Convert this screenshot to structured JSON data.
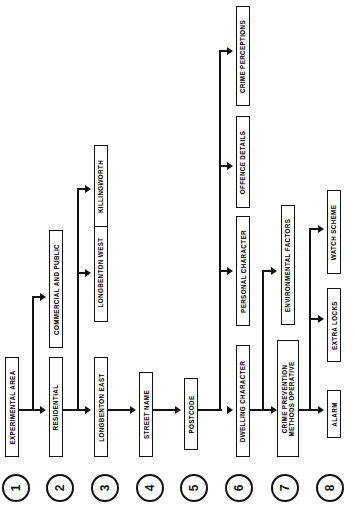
{
  "diagram": {
    "orientation": "rotated-90",
    "levels": [
      {
        "number": "1",
        "nodes": [
          {
            "id": "experimental-area",
            "label": "EXPERIMENTAL AREA"
          }
        ]
      },
      {
        "number": "2",
        "nodes": [
          {
            "id": "residential",
            "label": "RESIDENTIAL"
          },
          {
            "id": "commercial-and-public",
            "label": "COMMERCIAL AND PUBLIC"
          }
        ]
      },
      {
        "number": "3",
        "nodes": [
          {
            "id": "longbenton-east",
            "label": "LONGBENTON EAST"
          },
          {
            "id": "longbenton-west",
            "label": "LONGBENTON WEST"
          },
          {
            "id": "killingworth",
            "label": "KILLINGWORTH"
          }
        ]
      },
      {
        "number": "4",
        "nodes": [
          {
            "id": "street-name",
            "label": "STREET NAME"
          }
        ]
      },
      {
        "number": "5",
        "nodes": [
          {
            "id": "postcode",
            "label": "POSTCODE"
          }
        ]
      },
      {
        "number": "6",
        "nodes": [
          {
            "id": "dwelling-character",
            "label": "DWELLING CHARACTER"
          },
          {
            "id": "personal-character",
            "label": "PERSONAL CHARACTER"
          },
          {
            "id": "offence-details",
            "label": "OFFENCE DETAILS"
          },
          {
            "id": "crime-perceptions",
            "label": "CRIME PERCEPTIONS"
          }
        ]
      },
      {
        "number": "7",
        "nodes": [
          {
            "id": "crime-prevention-methods-operative",
            "label": "CRIME PREVENTION\nMETHODS OPERATIVE"
          },
          {
            "id": "environmental-factors",
            "label": "ENVIRONMENTAL FACTORS"
          }
        ]
      },
      {
        "number": "8",
        "nodes": [
          {
            "id": "alarm",
            "label": "ALARM"
          },
          {
            "id": "extra-locks",
            "label": "EXTRA LOCKS"
          },
          {
            "id": "watch-scheme",
            "label": "WATCH SCHEME"
          }
        ]
      }
    ],
    "level_markers": [
      "1",
      "2",
      "3",
      "4",
      "5",
      "6",
      "7",
      "8"
    ],
    "colors": {
      "stroke": "#111111",
      "background": "#ffffff",
      "text": "#000000"
    }
  }
}
